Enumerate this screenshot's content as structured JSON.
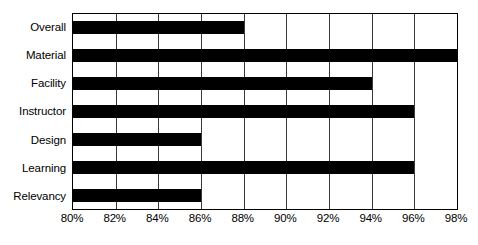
{
  "chart_data": {
    "type": "bar",
    "orientation": "horizontal",
    "title": "",
    "subtitle": "",
    "xlabel": "",
    "ylabel": "",
    "categories": [
      "Overall",
      "Material",
      "Facility",
      "Instructor",
      "Design",
      "Learning",
      "Relevancy"
    ],
    "values": [
      88,
      98,
      94,
      96,
      86,
      96,
      86
    ],
    "value_suffix": "%",
    "xlim": [
      80,
      98
    ],
    "tick_labels": [
      "80%",
      "82%",
      "84%",
      "86%",
      "88%",
      "90%",
      "92%",
      "94%",
      "96%",
      "98%"
    ],
    "tick_values": [
      80,
      82,
      84,
      86,
      88,
      90,
      92,
      94,
      96,
      98
    ],
    "grid": true,
    "grid_axis": "x",
    "legend": false,
    "legend_position": "none",
    "bar_color": "#000000",
    "plot_background": "#ffffff",
    "border_color": "#000000",
    "gridline_color": "#3a3a3a"
  }
}
